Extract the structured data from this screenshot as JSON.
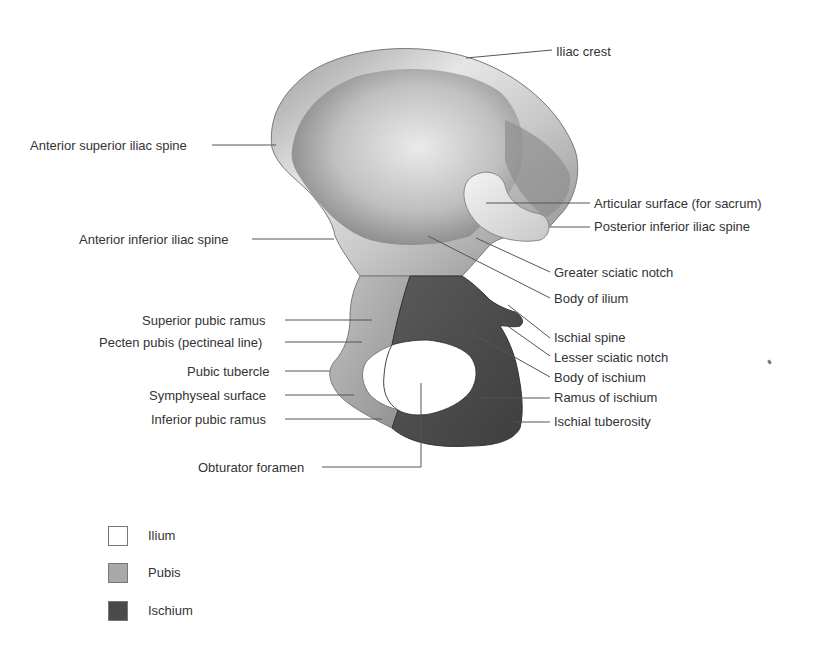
{
  "figure": {
    "colors": {
      "ilium": "#d8d8d8",
      "pubis": "#a8a8a8",
      "ischium": "#555555",
      "leader_line": "#555555",
      "text": "#333333"
    }
  },
  "labels": {
    "left": [
      "Anterior superior iliac spine",
      "Anterior inferior iliac spine",
      "Superior pubic ramus",
      "Pecten pubis (pectineal line)",
      "Pubic tubercle",
      "Symphyseal surface",
      "Inferior pubic ramus",
      "Obturator foramen"
    ],
    "right": [
      "Iliac crest",
      "Articular surface (for sacrum)",
      "Posterior inferior iliac spine",
      "Greater sciatic notch",
      "Body of ilium",
      "Ischial spine",
      "Lesser sciatic notch",
      "Body of ischium",
      "Ramus of ischium",
      "Ischial tuberosity"
    ]
  },
  "legend": [
    {
      "label": "Ilium",
      "color": "#ffffff"
    },
    {
      "label": "Pubis",
      "color": "#a9a9a9"
    },
    {
      "label": "Ischium",
      "color": "#4a4a4a"
    }
  ]
}
